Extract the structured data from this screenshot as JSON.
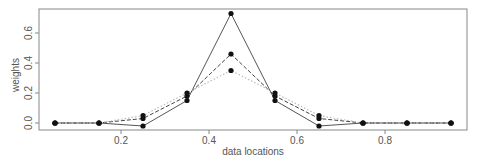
{
  "chart_data": {
    "type": "line",
    "title": "",
    "xlabel": "data locations",
    "ylabel": "weights",
    "x": [
      0.05,
      0.15,
      0.25,
      0.35,
      0.45,
      0.55,
      0.65,
      0.75,
      0.85,
      0.95
    ],
    "xticks": [
      0.2,
      0.4,
      0.6,
      0.8
    ],
    "xtick_labels": [
      "0.2",
      "0.4",
      "0.6",
      "0.8"
    ],
    "yticks": [
      0.0,
      0.2,
      0.4,
      0.6
    ],
    "ytick_labels": [
      "0.0",
      "0.2",
      "0.4",
      "0.6"
    ],
    "xlim": [
      0.005,
      0.985
    ],
    "ylim": [
      -0.05,
      0.76
    ],
    "grid": false,
    "legend": null,
    "series": [
      {
        "name": "solid",
        "style": "solid",
        "color": "#555555",
        "values": [
          0.0,
          0.0,
          -0.02,
          0.15,
          0.73,
          0.15,
          -0.02,
          0.0,
          0.0,
          0.0
        ]
      },
      {
        "name": "dashed",
        "style": "dashed",
        "color": "#444444",
        "values": [
          0.0,
          0.0,
          0.03,
          0.18,
          0.46,
          0.18,
          0.03,
          0.0,
          0.0,
          0.0
        ]
      },
      {
        "name": "dotted",
        "style": "dotted",
        "color": "#bbbbbb",
        "values": [
          0.0,
          0.0,
          0.05,
          0.2,
          0.35,
          0.2,
          0.05,
          0.0,
          0.0,
          0.0
        ]
      }
    ],
    "marker_color": "#111111"
  }
}
